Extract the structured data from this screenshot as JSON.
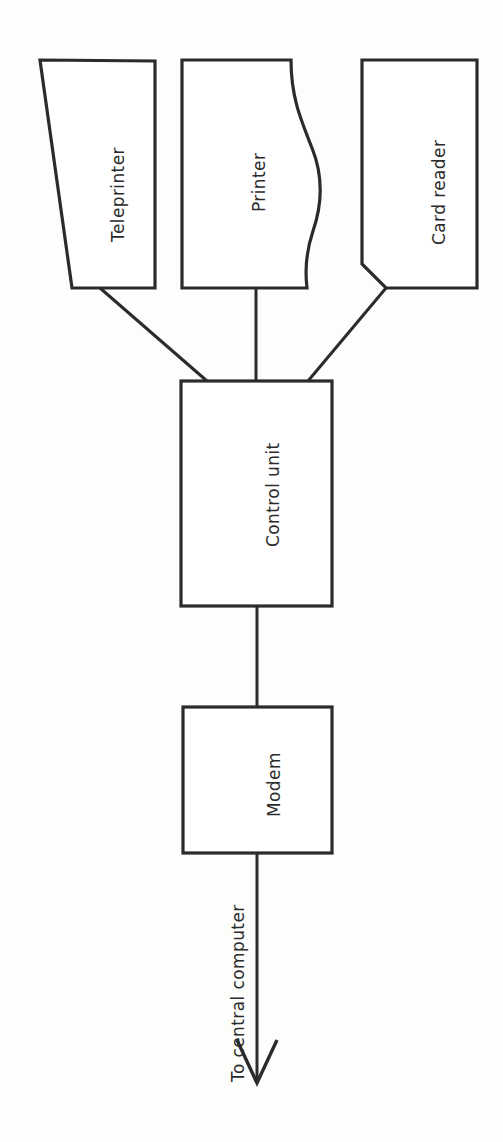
{
  "diagram": {
    "type": "block-diagram",
    "orientation": "text rotated 90 degrees counter-clockwise",
    "background_color": "#fdfdfc",
    "stroke_color": "#2b2b2b",
    "fill_color": "#ffffff",
    "nodes": [
      {
        "id": "teleprinter",
        "label": "Teleprinter",
        "shape": "trapezoid",
        "row": "top"
      },
      {
        "id": "printer",
        "label": "Printer",
        "shape": "rectangle-with-wavy-right-edge",
        "row": "top"
      },
      {
        "id": "card-reader",
        "label": "Card reader",
        "shape": "rectangle-with-chamfered-corner",
        "row": "top"
      },
      {
        "id": "control-unit",
        "label": "Control unit",
        "shape": "rectangle",
        "row": "middle"
      },
      {
        "id": "modem",
        "label": "Modem",
        "shape": "rectangle",
        "row": "bottom"
      }
    ],
    "edges": [
      {
        "from": "teleprinter",
        "to": "control-unit",
        "style": "line"
      },
      {
        "from": "printer",
        "to": "control-unit",
        "style": "line"
      },
      {
        "from": "card-reader",
        "to": "control-unit",
        "style": "line"
      },
      {
        "from": "control-unit",
        "to": "modem",
        "style": "line"
      },
      {
        "from": "modem",
        "to": "central-computer",
        "style": "arrow",
        "label": "To central computer"
      }
    ],
    "flow_label": "To central computer"
  }
}
